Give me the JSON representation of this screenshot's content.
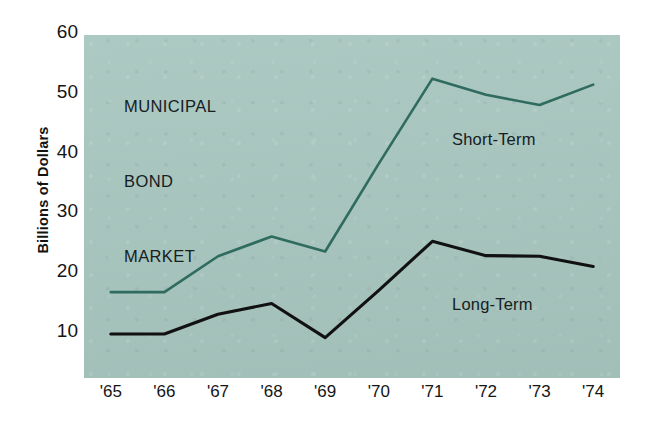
{
  "chart_data": {
    "type": "line",
    "title": "MUNICIPAL BOND MARKET",
    "title_lines": [
      "MUNICIPAL",
      "BOND",
      "MARKET"
    ],
    "xlabel": "",
    "ylabel": "Billions of Dollars",
    "categories": [
      "'65",
      "'66",
      "'67",
      "'68",
      "'69",
      "'70",
      "'71",
      "'72",
      "'73",
      "'74"
    ],
    "y_ticks": [
      10,
      20,
      30,
      40,
      50,
      60
    ],
    "ylim": [
      5,
      60
    ],
    "grid": false,
    "legend_position": "inline-annotation",
    "series": [
      {
        "name": "Short-Term",
        "color": "#2f6b5f",
        "values": [
          16.5,
          16.5,
          22.5,
          25.8,
          23.3,
          38.0,
          52.2,
          49.5,
          47.8,
          51.2
        ]
      },
      {
        "name": "Long-Term",
        "color": "#111111",
        "values": [
          9.5,
          9.5,
          12.8,
          14.6,
          8.9,
          16.8,
          25.0,
          22.6,
          22.5,
          20.8
        ]
      }
    ],
    "annotations": [
      {
        "text": "Short-Term",
        "series": "Short-Term"
      },
      {
        "text": "Long-Term",
        "series": "Long-Term"
      }
    ],
    "colors": {
      "panel_background": "#a8c6bf",
      "page_background": "#ffffff",
      "short_term_line": "#2f6b5f",
      "long_term_line": "#111111",
      "text": "#151515"
    }
  }
}
